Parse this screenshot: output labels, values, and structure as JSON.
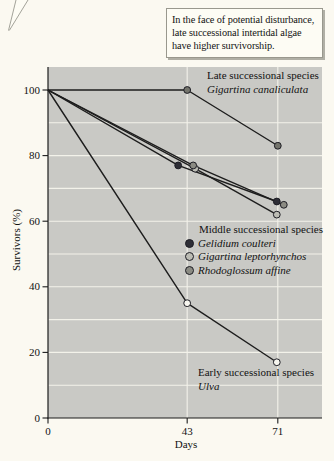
{
  "figure": {
    "background": "#fbf9f1",
    "plot_bg": "#c9c9c5",
    "grid_color": "#f3f2ea",
    "axis_color": "#1d1d1d",
    "line_color": "#1d1d1d",
    "text_color": "#121212"
  },
  "callout": {
    "lines": [
      "In the face of potential disturbance,",
      "late successional intertidal algae",
      "have higher survivorship."
    ],
    "bg": "#fdfcf4",
    "border": "#99988e"
  },
  "annotations": {
    "late_heading": "Late successional species",
    "middle_heading": "Middle successional species",
    "early_heading": "Early successional species"
  },
  "chart_data": {
    "type": "line",
    "xlabel": "Days",
    "ylabel": "Survivors (%)",
    "x": [
      0,
      43,
      71
    ],
    "x_ticks": [
      "0",
      "43",
      "71"
    ],
    "y_ticks": [
      0,
      20,
      40,
      60,
      80,
      100
    ],
    "y_gridlines_every": 10,
    "x_gridlines_at_days": [
      43,
      71
    ],
    "xlim": [
      0,
      85
    ],
    "ylim": [
      0,
      107
    ],
    "grid": true,
    "legend_position": "inside-right",
    "series": [
      {
        "name": "Gigartina canaliculata",
        "group": "Late successional species",
        "values": [
          100,
          100,
          83
        ],
        "marker_fill": "#74746c",
        "marker_open": false,
        "marker_dx": [
          0,
          0,
          0
        ]
      },
      {
        "name": "Gelidium coulteri",
        "group": "Middle successional species",
        "values": [
          100,
          77,
          66
        ],
        "marker_fill": "#2e2e36",
        "marker_open": false,
        "marker_dx": [
          0,
          -9,
          -1
        ]
      },
      {
        "name": "Gigartina leptorhynchos",
        "group": "Middle successional species",
        "values": [
          100,
          76,
          62
        ],
        "marker_fill": "#bcbcb4",
        "marker_open": false,
        "marker_dx": [
          0,
          8,
          -1
        ]
      },
      {
        "name": "Rhodoglossum affine",
        "group": "Middle successional species",
        "values": [
          100,
          77,
          65
        ],
        "marker_fill": "#8b8b83",
        "marker_open": false,
        "marker_dx": [
          0,
          6,
          6
        ]
      },
      {
        "name": "Ulva",
        "group": "Early successional species",
        "values": [
          100,
          35,
          17
        ],
        "marker_fill": "#f7f6ef",
        "marker_open": true,
        "marker_dx": [
          0,
          0,
          -1
        ]
      }
    ]
  }
}
